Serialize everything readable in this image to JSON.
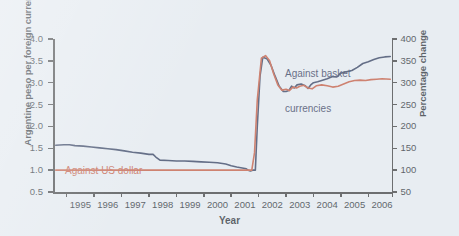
{
  "chart_data": {
    "type": "line",
    "title": "",
    "xlabel": "Year",
    "ylabel": "Argentine peso per foreign currency unit",
    "ylabel_right": "Percentage change",
    "xlim": [
      1994.5,
      2006.9
    ],
    "ylim": [
      0.5,
      4.0
    ],
    "ylim_right": [
      50,
      400
    ],
    "grid": false,
    "legend_position": "inline-annotations",
    "yticks": [
      "0.5",
      "1.0",
      "1.5",
      "2.0",
      "2.5",
      "3.0",
      "3.5",
      "4.0"
    ],
    "yticks_right": [
      "50",
      "100",
      "150",
      "200",
      "250",
      "300",
      "350",
      "400"
    ],
    "xticks": [
      "1995",
      "1996",
      "1997",
      "1998",
      "1999",
      "2000",
      "2001",
      "2002",
      "2003",
      "2004",
      "2005",
      "2006"
    ],
    "annotations": [
      {
        "text": "Against basket\ncurrencies",
        "color": "#1d2a4d"
      },
      {
        "text": "Against US dollar",
        "color": "#c0492c"
      }
    ],
    "series": [
      {
        "name": "Against basket currencies",
        "color": "#1d2a4d",
        "x": [
          1994.6,
          1994.9,
          1995.1,
          1995.3,
          1995.6,
          1995.9,
          1996.2,
          1996.5,
          1996.8,
          1997.1,
          1997.4,
          1997.7,
          1998.0,
          1998.15,
          1998.25,
          1998.4,
          1998.7,
          1999.0,
          1999.3,
          1999.6,
          1999.9,
          2000.2,
          2000.5,
          2000.8,
          2001.0,
          2001.2,
          2001.4,
          2001.55,
          2001.62,
          2001.7,
          2001.78,
          2001.88,
          2001.95,
          2002.05,
          2002.15,
          2002.3,
          2002.45,
          2002.6,
          2002.75,
          2002.9,
          2003.0,
          2003.1,
          2003.2,
          2003.3,
          2003.4,
          2003.55,
          2003.7,
          2003.8,
          2003.9,
          2004.0,
          2004.15,
          2004.3,
          2004.5,
          2004.7,
          2004.85,
          2005.0,
          2005.2,
          2005.4,
          2005.6,
          2005.8,
          2006.0,
          2006.2,
          2006.4,
          2006.6,
          2006.8
        ],
        "y": [
          1.57,
          1.58,
          1.58,
          1.56,
          1.55,
          1.53,
          1.51,
          1.49,
          1.47,
          1.44,
          1.41,
          1.39,
          1.36,
          1.36,
          1.3,
          1.23,
          1.22,
          1.21,
          1.21,
          1.2,
          1.19,
          1.18,
          1.17,
          1.14,
          1.1,
          1.07,
          1.05,
          1.03,
          1.0,
          0.98,
          1.0,
          1.0,
          2.0,
          3.15,
          3.58,
          3.55,
          3.4,
          3.15,
          2.92,
          2.8,
          2.8,
          2.82,
          2.92,
          2.88,
          2.95,
          2.97,
          2.93,
          2.87,
          2.95,
          3.0,
          3.02,
          3.05,
          3.09,
          3.14,
          3.13,
          3.22,
          3.25,
          3.28,
          3.35,
          3.44,
          3.48,
          3.53,
          3.57,
          3.59,
          3.6
        ]
      },
      {
        "name": "Against US dollar",
        "color": "#c0492c",
        "x": [
          1994.6,
          1995.5,
          1996.5,
          1997.5,
          1998.5,
          1999.5,
          2000.5,
          2001.3,
          2001.6,
          2001.75,
          2001.85,
          2001.95,
          2002.1,
          2002.25,
          2002.4,
          2002.55,
          2002.7,
          2002.85,
          2003.0,
          2003.12,
          2003.25,
          2003.38,
          2003.5,
          2003.65,
          2003.8,
          2003.95,
          2004.1,
          2004.3,
          2004.5,
          2004.7,
          2004.9,
          2005.1,
          2005.3,
          2005.5,
          2005.7,
          2005.9,
          2006.1,
          2006.3,
          2006.5,
          2006.8
        ],
        "y": [
          1.0,
          1.0,
          1.0,
          1.0,
          1.0,
          1.0,
          1.0,
          1.0,
          1.0,
          1.0,
          1.4,
          2.6,
          3.56,
          3.62,
          3.5,
          3.2,
          2.95,
          2.83,
          2.85,
          2.82,
          2.9,
          2.88,
          2.92,
          2.94,
          2.88,
          2.86,
          2.93,
          2.95,
          2.93,
          2.9,
          2.92,
          2.97,
          3.02,
          3.05,
          3.06,
          3.05,
          3.07,
          3.08,
          3.09,
          3.08
        ]
      }
    ]
  },
  "axis": {
    "left_title": "Argentine peso per foreign currency unit",
    "right_title": "Percentage change",
    "x_title": "Year"
  },
  "annotations": {
    "basket_line1": "Against basket",
    "basket_line2": "currencies",
    "dollar": "Against US dollar"
  },
  "colors": {
    "basket": "#1d2a4d",
    "dollar": "#c0492c",
    "background": "#e8edf2",
    "axis": "#2b2b2b"
  }
}
